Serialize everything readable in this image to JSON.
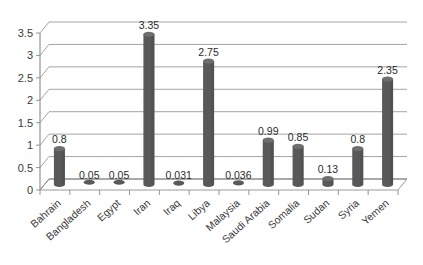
{
  "chart_data": {
    "type": "bar",
    "title": "",
    "subtitle": "",
    "xlabel": "",
    "ylabel": "",
    "ylim": [
      0,
      3.5
    ],
    "yticks": [
      "0",
      "0.5",
      "1",
      "1.5",
      "2",
      "2.5",
      "3",
      "3.5"
    ],
    "ytick_values": [
      0,
      0.5,
      1,
      1.5,
      2,
      2.5,
      3,
      3.5
    ],
    "grid": true,
    "legend": "none",
    "style": "3d-cylinder",
    "categories": [
      "Bahrain",
      "Bangladesh",
      "Egypt",
      "Iran",
      "Iraq",
      "Libya",
      "Malaysia",
      "Saudi Arabia",
      "Somalia",
      "Sudan",
      "Syria",
      "Yemen"
    ],
    "values": [
      0.8,
      0.05,
      0.05,
      3.35,
      0.031,
      2.75,
      0.036,
      0.99,
      0.85,
      0.13,
      0.8,
      2.35
    ],
    "data_labels": [
      "0.8",
      "0.05",
      "0.05",
      "3.35",
      "0.031",
      "2.75",
      "0.036",
      "0.99",
      "0.85",
      "0.13",
      "0.8",
      "2.35"
    ],
    "series": [
      {
        "name": "",
        "values": [
          0.8,
          0.05,
          0.05,
          3.35,
          0.031,
          2.75,
          0.036,
          0.99,
          0.85,
          0.13,
          0.8,
          2.35
        ]
      }
    ]
  },
  "colors": {
    "bar": "#595959",
    "bar_top": "#6e6e6e",
    "grid": "#9a9a9a",
    "axis": "#7d7d7d",
    "text": "#3a3a3a",
    "background": "#ffffff"
  }
}
